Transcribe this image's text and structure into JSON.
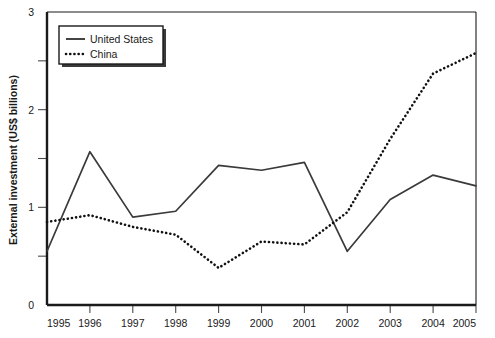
{
  "chart_data": {
    "type": "line",
    "title": "",
    "xlabel": "",
    "ylabel": "External investment (US$ billions)",
    "x": [
      1995,
      1996,
      1997,
      1998,
      1999,
      2000,
      2001,
      2002,
      2003,
      2004,
      2005
    ],
    "categories": [
      "1995",
      "1996",
      "1997",
      "1998",
      "1999",
      "2000",
      "2001",
      "2002",
      "2003",
      "2004",
      "2005"
    ],
    "series": [
      {
        "name": "United States",
        "style": "solid",
        "values": [
          0.55,
          1.57,
          0.9,
          0.96,
          1.43,
          1.38,
          1.46,
          0.55,
          1.08,
          1.33,
          1.22
        ]
      },
      {
        "name": "China",
        "style": "dotted",
        "values": [
          0.85,
          0.92,
          0.8,
          0.72,
          0.38,
          0.65,
          0.62,
          0.95,
          1.7,
          2.37,
          2.58
        ]
      }
    ],
    "xlim": [
      1995,
      2005
    ],
    "ylim": [
      0,
      3
    ],
    "yticks": [
      0,
      1,
      2,
      3
    ],
    "ytick_labels": [
      "0",
      "1",
      "2",
      "3"
    ],
    "yminor_ticks": [
      0.5,
      1.5,
      2.5
    ],
    "grid": false,
    "legend_position": "top-left",
    "legend_entries": [
      {
        "label": "United States",
        "style": "solid"
      },
      {
        "label": "China",
        "style": "dotted"
      }
    ],
    "colors": {
      "united_states": "#3a3a3a",
      "china": "#111111",
      "axis": "#1a1a1a",
      "background": "#ffffff"
    }
  }
}
